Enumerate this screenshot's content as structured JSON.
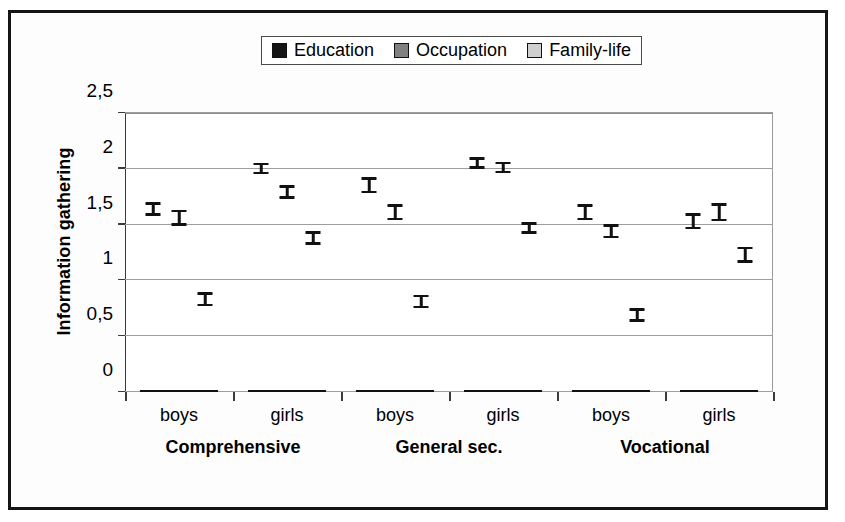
{
  "chart_data": {
    "type": "bar",
    "title": "",
    "xlabel": "",
    "ylabel": "Information gathering",
    "ylim": [
      0,
      2.5
    ],
    "yticks": [
      "0",
      "0,5",
      "1",
      "1,5",
      "2",
      "2,5"
    ],
    "ytick_values": [
      0,
      0.5,
      1,
      1.5,
      2,
      2.5
    ],
    "grid": true,
    "legend_position": "top-center",
    "categories": [
      "boys",
      "girls",
      "boys",
      "girls",
      "boys",
      "girls"
    ],
    "groups": [
      {
        "label": "Comprehensive",
        "categories": [
          "boys",
          "girls"
        ]
      },
      {
        "label": "General sec.",
        "categories": [
          "boys",
          "girls"
        ]
      },
      {
        "label": "Vocational",
        "categories": [
          "boys",
          "girls"
        ]
      }
    ],
    "series": [
      {
        "name": "Education",
        "color": "#151515",
        "values": [
          1.63,
          1.99,
          1.84,
          2.04,
          1.6,
          1.52
        ],
        "errors": [
          0.05,
          0.04,
          0.06,
          0.04,
          0.06,
          0.06
        ]
      },
      {
        "name": "Occupation",
        "color": "#808080",
        "values": [
          1.55,
          1.78,
          1.6,
          2.0,
          1.43,
          1.6
        ],
        "errors": [
          0.06,
          0.05,
          0.06,
          0.04,
          0.05,
          0.07
        ]
      },
      {
        "name": "Family-life",
        "color": "#cfcfcf",
        "values": [
          0.82,
          1.37,
          0.8,
          1.46,
          0.68,
          1.22
        ],
        "errors": [
          0.05,
          0.05,
          0.05,
          0.04,
          0.05,
          0.06
        ]
      }
    ]
  },
  "legend": {
    "items": [
      {
        "label": "Education",
        "color": "#151515"
      },
      {
        "label": "Occupation",
        "color": "#808080"
      },
      {
        "label": "Family-life",
        "color": "#cfcfcf"
      }
    ]
  },
  "axes": {
    "y_title": "Information gathering"
  }
}
